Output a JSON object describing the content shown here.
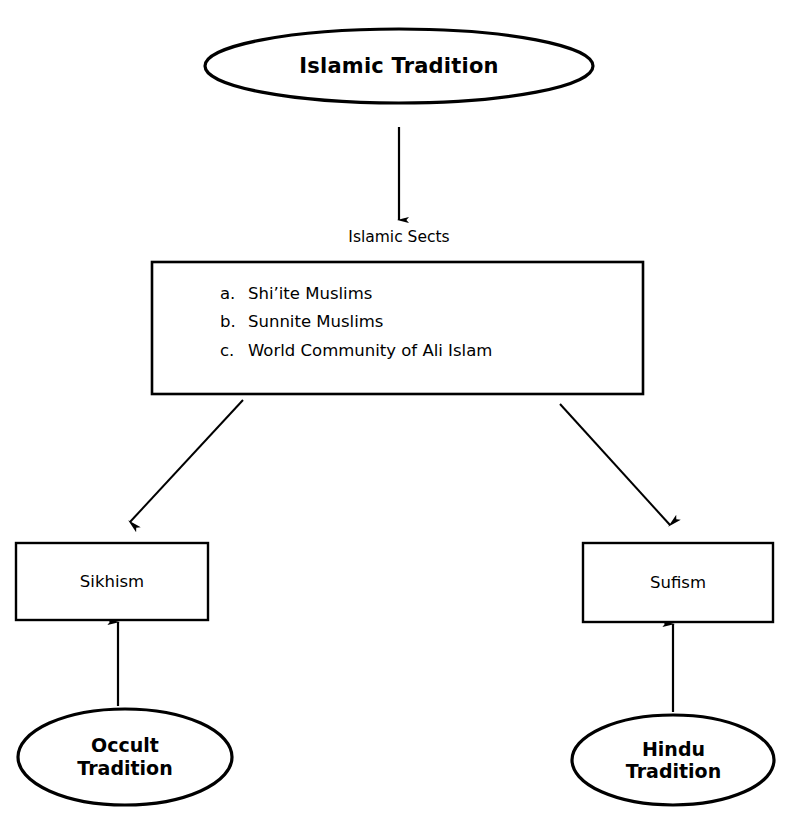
{
  "diagram": {
    "title": "Islamic Tradition",
    "root_node": {
      "name": "islamic-tradition",
      "label": "Islamic Tradition",
      "shape": "ellipse"
    },
    "connector_caption": "Islamic Sects",
    "sects_box": {
      "name": "islamic-sects-list",
      "shape": "rectangle",
      "items": [
        {
          "marker": "a.",
          "label": "Shi’ite Muslims"
        },
        {
          "marker": "b.",
          "label": "Sunnite Muslims"
        },
        {
          "marker": "c.",
          "label": "World Community of Ali Islam"
        }
      ]
    },
    "branch_nodes": [
      {
        "name": "sikhism",
        "label": "Sikhism",
        "shape": "rectangle"
      },
      {
        "name": "sufism",
        "label": "Sufism",
        "shape": "rectangle"
      }
    ],
    "source_nodes": [
      {
        "name": "occult-tradition",
        "line1": "Occult",
        "line2": "Tradition",
        "shape": "ellipse"
      },
      {
        "name": "hindu-tradition",
        "line1": "Hindu",
        "line2": "Tradition",
        "shape": "ellipse"
      }
    ],
    "colors": {
      "stroke": "#000000",
      "background": "#ffffff",
      "text": "#000000"
    }
  }
}
